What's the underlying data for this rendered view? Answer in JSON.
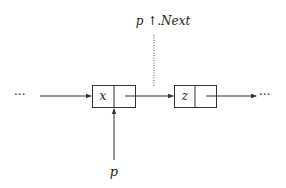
{
  "diagram": {
    "type": "linked-list-pointer",
    "colors": {
      "line": "#333333",
      "text": "#222222",
      "background": "#ffffff"
    },
    "ellipsis_left": "···",
    "ellipsis_right": "···",
    "nodes": [
      {
        "id": "node-x",
        "value": "x"
      },
      {
        "id": "node-z",
        "value": "z"
      }
    ],
    "labels": {
      "next_pointer": "p ↑.Next",
      "pointer_p": "p"
    },
    "edges": [
      {
        "from": "left-ellipsis",
        "to": "node-x",
        "style": "solid-arrow"
      },
      {
        "from": "node-x.next",
        "to": "node-z",
        "style": "solid-arrow"
      },
      {
        "from": "node-z.next",
        "to": "right-ellipsis",
        "style": "solid-arrow"
      },
      {
        "from": "p",
        "to": "node-x",
        "style": "solid-arrow"
      },
      {
        "from": "p↑.Next-label",
        "to": "edge x→z",
        "style": "dotted"
      }
    ]
  }
}
